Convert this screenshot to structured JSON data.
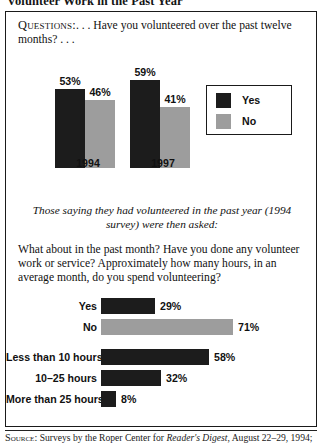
{
  "title": "Volunteer Work in the Past Year",
  "questions": {
    "label": "Questions:",
    "text": ". . . Have you volunteered over the past twelve months? . . ."
  },
  "legend": {
    "items": [
      {
        "label": "Yes",
        "color": "#1c1c1c"
      },
      {
        "label": "No",
        "color": "#9d9d9d"
      }
    ]
  },
  "lead_in": "Those saying they had volunteered in the past year (1994 survey) were then asked:",
  "followup": "What about in the past month?  Have you done any volunteer work or service? Approximately how many hours, in an average month, do you spend volunteering?",
  "source": {
    "label": "Source:",
    "text_before": " Surveys by the Roper Center for ",
    "italic": "Reader's Digest",
    "text_after": ", August 22–29, 1994;"
  },
  "chart_data": [
    {
      "type": "bar",
      "title": "Have you volunteered over the past twelve months?",
      "orientation": "vertical",
      "categories": [
        "1994",
        "1997"
      ],
      "series": [
        {
          "name": "Yes",
          "values": [
            53,
            59
          ],
          "color": "#1c1c1c"
        },
        {
          "name": "No",
          "values": [
            46,
            41
          ],
          "color": "#9d9d9d"
        }
      ],
      "value_labels": [
        [
          "53%",
          "46%"
        ],
        [
          "59%",
          "41%"
        ]
      ],
      "ylabel": "",
      "xlabel": "",
      "ylim": [
        0,
        100
      ],
      "grid": false,
      "legend_position": "right"
    },
    {
      "type": "bar",
      "title": "Have you done any volunteer work or service in the past month?",
      "orientation": "horizontal",
      "categories": [
        "Yes",
        "No"
      ],
      "values": [
        29,
        71
      ],
      "value_labels": [
        "29%",
        "71%"
      ],
      "colors": [
        "#1c1c1c",
        "#9d9d9d"
      ],
      "xlim": [
        0,
        100
      ],
      "grid": false
    },
    {
      "type": "bar",
      "title": "Approximately how many hours, in an average month, do you spend volunteering?",
      "orientation": "horizontal",
      "categories": [
        "Less than 10 hours",
        "10–25 hours",
        "More than 25 hours"
      ],
      "values": [
        58,
        32,
        8
      ],
      "value_labels": [
        "58%",
        "32%",
        "8%"
      ],
      "colors": [
        "#1c1c1c",
        "#1c1c1c",
        "#1c1c1c"
      ],
      "xlim": [
        0,
        100
      ],
      "grid": false
    }
  ]
}
